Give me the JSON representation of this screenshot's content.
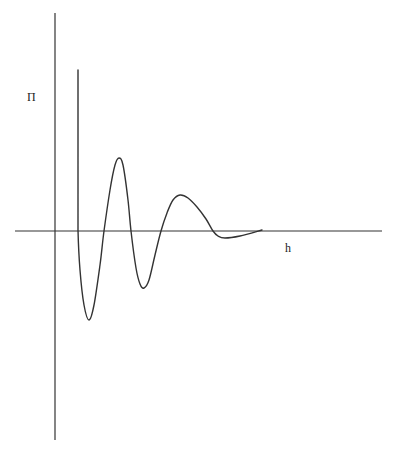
{
  "chart_data": {
    "type": "line",
    "title": "",
    "xlabel": "h",
    "ylabel": "Π",
    "grid": false,
    "legend": null,
    "series": [
      {
        "name": "Π(h)",
        "points_px": [
          [
            78,
            70
          ],
          [
            78,
            230
          ],
          [
            80,
            270
          ],
          [
            84,
            305
          ],
          [
            89,
            320
          ],
          [
            94,
            305
          ],
          [
            100,
            265
          ],
          [
            104,
            231
          ],
          [
            110,
            190
          ],
          [
            115,
            165
          ],
          [
            119,
            158
          ],
          [
            123,
            165
          ],
          [
            128,
            200
          ],
          [
            131,
            231
          ],
          [
            136,
            268
          ],
          [
            140,
            284
          ],
          [
            144,
            288
          ],
          [
            149,
            280
          ],
          [
            155,
            255
          ],
          [
            161,
            231
          ],
          [
            167,
            213
          ],
          [
            173,
            200
          ],
          [
            180,
            195
          ],
          [
            188,
            198
          ],
          [
            197,
            207
          ],
          [
            206,
            219
          ],
          [
            213,
            231
          ],
          [
            218,
            236
          ],
          [
            225,
            238
          ],
          [
            240,
            236
          ],
          [
            262,
            230
          ]
        ]
      }
    ],
    "axes": {
      "x_axis_px": {
        "x1": 15,
        "x2": 382,
        "y": 231
      },
      "y_axis_px": {
        "x": 55,
        "y1": 13,
        "y2": 440
      }
    },
    "labels": [
      {
        "text": "Π",
        "x": 27,
        "y": 101
      },
      {
        "text": "h",
        "x": 285,
        "y": 252
      }
    ]
  },
  "colors": {
    "line": "#333333",
    "background": "#ffffff"
  }
}
